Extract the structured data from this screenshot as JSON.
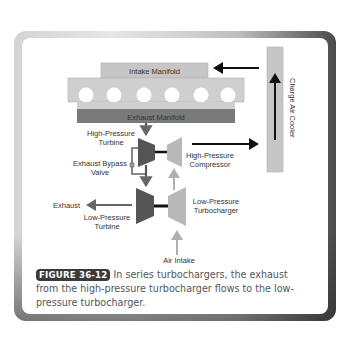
{
  "figure": {
    "badge": "FIGURE 36-12",
    "caption": "In series turbochargers, the exhaust from the high-pressure turbocharger flows to the low-pressure turbocharger."
  },
  "diagram": {
    "intake_manifold": "Intake Manifold",
    "exhaust_manifold": "Exhaust Manifold",
    "charge_air_cooler": "Charge Air Cooler",
    "hp_turbine_line1": "High-Pressure",
    "hp_turbine_line2": "Turbine",
    "hp_compressor_line1": "High-Pressure",
    "hp_compressor_line2": "Compressor",
    "bypass_line1": "Exhaust Bypass",
    "bypass_line2": "Valve",
    "exhaust": "Exhaust",
    "lp_turbine_line1": "Low-Pressure",
    "lp_turbine_line2": "Turbine",
    "lp_turbo_line1": "Low-Pressure",
    "lp_turbo_line2": "Turbocharger",
    "air_intake": "Air Intake",
    "cylinder_count": 6,
    "colors": {
      "light_gray": "#c2c2c2",
      "engine_block": "#cfcfcf",
      "exhaust_manifold": "#7a7a7a",
      "turbine_dark": "#555555",
      "compressor_light": "#b4b4b4",
      "arrow_dark": "#111111",
      "arrow_gray": "#666666",
      "arrow_light": "#b0b0b0"
    }
  }
}
